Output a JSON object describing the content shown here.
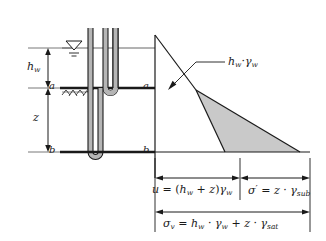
{
  "figure": {
    "type": "geotechnical-soil-stress-diagram",
    "title_visible": false,
    "colors": {
      "line": "#1a1a1a",
      "shade_fill": "#c9c9c9",
      "tube_fill": "#b5b5b5",
      "thin_line": "#555555",
      "background": "#ffffff"
    },
    "labels": {
      "depth_hw": {
        "base": "h",
        "sub": "w"
      },
      "depth_z": {
        "base": "z"
      },
      "point_a_left": "a",
      "point_a_right": "a",
      "point_b_left": "b",
      "point_b_right": "b",
      "callout_hw_gamma_w": {
        "h": "h",
        "h_sub": "w",
        "dot": "·",
        "gamma": "γ",
        "gamma_sub": "w"
      }
    },
    "equations": {
      "pore_pressure": {
        "lhs": "u",
        "eq": "=",
        "rhs_open": "(",
        "h": "h",
        "h_sub": "w",
        "plus": "+",
        "z": "z",
        "rhs_close": ")",
        "gamma": "γ",
        "gamma_sub": "w",
        "full_text": "u = (h_w + z)γ_w"
      },
      "effective_stress": {
        "sigma": "σ",
        "prime": "′",
        "eq": "=",
        "z": "z",
        "dot": "·",
        "gamma": "γ",
        "gamma_sub": "sub",
        "full_text": "σ′ = z · γ_sub"
      },
      "total_stress": {
        "sigma": "σ",
        "sigma_sub": "v",
        "eq": "=",
        "h": "h",
        "h_sub": "w",
        "dot1": "·",
        "gamma1": "γ",
        "gamma1_sub": "w",
        "plus": "+",
        "z": "z",
        "dot2": "·",
        "gamma2": "γ",
        "gamma2_sub": "sat",
        "full_text": "σ_v = h_w · γ_w + z · γ_sat"
      }
    },
    "symbols": {
      "water_table": "water-table-triangle",
      "ground_hatch": "ground-surface-hatching",
      "piezometer_upper": "u-tube-at-level-a",
      "piezometer_lower": "u-tube-at-level-b"
    }
  }
}
